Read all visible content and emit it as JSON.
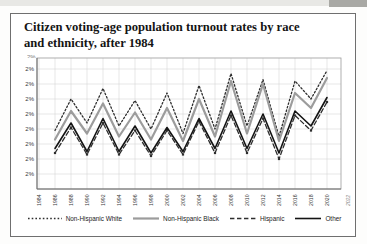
{
  "card": {
    "title_lines": [
      "Citizen voting-age population turnout rates by race",
      "and ethnicity, after 1984"
    ]
  },
  "chart_data": {
    "type": "line",
    "title": "Citizen voting-age population turnout rates by race and ethnicity, after 1984",
    "xlabel": "",
    "ylabel": "",
    "grid": true,
    "legend_position": "bottom",
    "xtick_labels": [
      "1984",
      "1986",
      "1988",
      "1990",
      "1992",
      "1994",
      "1996",
      "1998",
      "2000",
      "2002",
      "2004",
      "2006",
      "2008",
      "2010",
      "2012",
      "2014",
      "2016",
      "2018",
      "2020"
    ],
    "x_edge_label": "2022",
    "ytick_labels": [
      "2%",
      "2%",
      "2%",
      "2%",
      "2%",
      "2%",
      "2%",
      "2%"
    ],
    "ytick_top_partial": "2%",
    "value_scale": "gridline units estimated from pixels; one horizontal gridline interval = 1.0; every y tick renders as 2%",
    "x": [
      1986,
      1988,
      1990,
      1992,
      1994,
      1996,
      1998,
      2000,
      2002,
      2004,
      2006,
      2008,
      2010,
      2012,
      2014,
      2016,
      2018,
      2020
    ],
    "series": [
      {
        "name": "Non-Hispanic White",
        "style": "dotted",
        "color": "#2e2e2e",
        "width": 1.3,
        "marker": "none",
        "values": [
          3.9,
          6.0,
          4.4,
          6.7,
          4.2,
          5.9,
          4.0,
          6.4,
          3.7,
          6.9,
          4.0,
          7.7,
          4.2,
          7.3,
          3.5,
          7.2,
          6.0,
          7.9
        ]
      },
      {
        "name": "Non-Hispanic Black",
        "style": "solid",
        "color": "#9c9c9c",
        "width": 2.2,
        "marker": "none",
        "values": [
          3.3,
          5.2,
          3.7,
          5.7,
          3.5,
          5.1,
          3.3,
          5.4,
          3.2,
          6.0,
          3.5,
          7.2,
          3.7,
          7.0,
          3.2,
          6.4,
          5.4,
          7.4
        ]
      },
      {
        "name": "Hispanic",
        "style": "dashed",
        "color": "#2e2e2e",
        "width": 1.3,
        "marker": "square",
        "values": [
          2.4,
          4.1,
          2.3,
          4.4,
          2.3,
          3.9,
          2.2,
          3.9,
          2.3,
          4.5,
          2.4,
          4.9,
          2.4,
          4.7,
          2.0,
          4.9,
          3.9,
          5.8
        ]
      },
      {
        "name": "Other",
        "style": "solid",
        "color": "#141414",
        "width": 1.6,
        "marker": "none",
        "values": [
          2.7,
          4.4,
          2.5,
          4.7,
          2.5,
          4.2,
          2.4,
          4.1,
          2.5,
          4.7,
          2.7,
          5.2,
          2.7,
          5.0,
          2.4,
          5.2,
          4.2,
          6.1
        ]
      }
    ]
  },
  "colors": {
    "card_border": "#6f6f6f",
    "grid": "#d6d6d6",
    "axis": "#6f6f6f",
    "frame": "#9b9b9b",
    "tick_text": "#3a3a3a",
    "edge_label_text": "#8a8a8a"
  }
}
